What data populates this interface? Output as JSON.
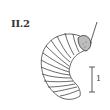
{
  "figure": {
    "label": "II.2",
    "scale_bar": {
      "label": "1"
    },
    "colors": {
      "ink": "#333333",
      "head_shading": "#b8b8b8",
      "background": "#ffffff"
    }
  }
}
